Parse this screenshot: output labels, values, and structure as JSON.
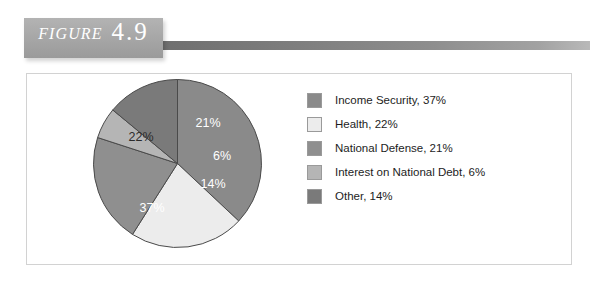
{
  "figure": {
    "label_word": "Figure",
    "number": "4.9"
  },
  "chart_data": {
    "type": "pie",
    "title": "",
    "subtitle": "",
    "xlabel": "",
    "ylabel": "",
    "legend_position": "right",
    "grid": false,
    "start_angle_deg": 0,
    "direction": "clockwise",
    "categories": [
      "Income Security",
      "Health",
      "National Defense",
      "Interest on National Debt",
      "Other"
    ],
    "values": [
      37,
      22,
      21,
      6,
      14
    ],
    "units": "%",
    "slices": [
      {
        "name": "Income Security",
        "value": 37,
        "slice_label": "37%",
        "legend_label": "Income Security, 37%",
        "color": "#8a8a8a",
        "label_color": "#ffffff",
        "label_x": 152,
        "label_y": 212
      },
      {
        "name": "Health",
        "value": 22,
        "slice_label": "22%",
        "legend_label": "Health, 22%",
        "color": "#ececec",
        "label_color": "#2b2b2b",
        "label_x": 141,
        "label_y": 141
      },
      {
        "name": "National Defense",
        "value": 21,
        "slice_label": "21%",
        "legend_label": "National Defense, 21%",
        "color": "#8f8f8f",
        "label_color": "#ffffff",
        "label_x": 208,
        "label_y": 127
      },
      {
        "name": "Interest on National Debt",
        "value": 6,
        "slice_label": "6%",
        "legend_label": "Interest on National Debt, 6%",
        "color": "#b5b5b5",
        "label_color": "#ffffff",
        "label_x": 222,
        "label_y": 160
      },
      {
        "name": "Other",
        "value": 14,
        "slice_label": "14%",
        "legend_label": "Other, 14%",
        "color": "#7a7a7a",
        "label_color": "#ffffff",
        "label_x": 213,
        "label_y": 188
      }
    ]
  },
  "legend": {
    "items": [
      {
        "label": "Income Security, 37%",
        "color": "#8a8a8a"
      },
      {
        "label": "Health, 22%",
        "color": "#ececec"
      },
      {
        "label": "National Defense, 21%",
        "color": "#8f8f8f"
      },
      {
        "label": "Interest on National Debt, 6%",
        "color": "#b5b5b5"
      },
      {
        "label": "Other, 14%",
        "color": "#7a7a7a"
      }
    ]
  }
}
